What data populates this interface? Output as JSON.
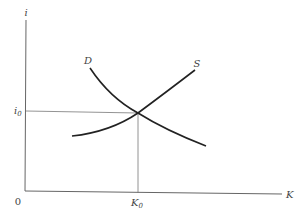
{
  "diagram": {
    "type": "supply-demand",
    "axes": {
      "y_label": "i",
      "x_label": "K",
      "origin_label": "0"
    },
    "curves": [
      {
        "name": "D",
        "label": "D"
      },
      {
        "name": "S",
        "label": "S"
      }
    ],
    "equilibrium": {
      "y_label_base": "i",
      "y_label_sub": "0",
      "x_label_base": "K",
      "x_label_sub": "0"
    },
    "colors": {
      "axis": "#555555",
      "curve": "#222222",
      "text": "#444444"
    }
  }
}
